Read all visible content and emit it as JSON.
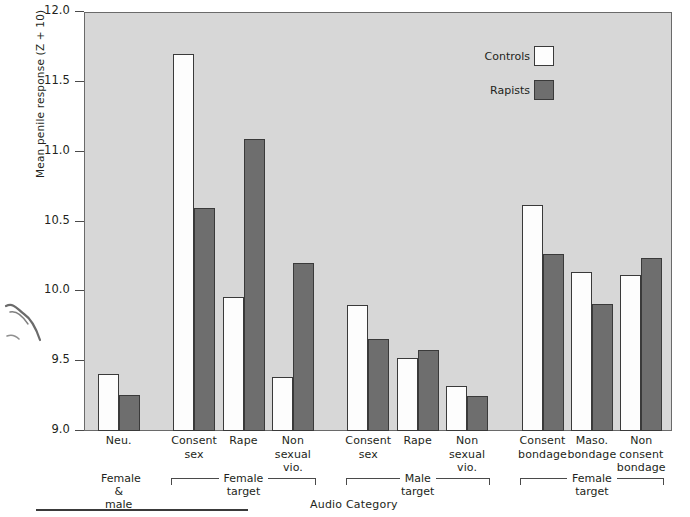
{
  "chart_data": {
    "type": "bar",
    "title": "",
    "xlabel": "Audio Category",
    "ylabel": "Mean penile response (Z + 10)",
    "ylim": [
      9.0,
      12.0
    ],
    "yticks": [
      "9.0",
      "9.5",
      "10.0",
      "10.5",
      "11.0",
      "11.5",
      "12.0"
    ],
    "ytick_values": [
      9.0,
      9.5,
      10.0,
      10.5,
      11.0,
      11.5,
      12.0
    ],
    "grid": false,
    "legend_position": "top-right",
    "categories": [
      "Neu.",
      "Consent sex",
      "Rape",
      "Non sexual vio.",
      "Consent sex",
      "Rape",
      "Non sexual vio.",
      "Consent bondage",
      "Maso. bondage",
      "Non consent bondage"
    ],
    "category_lines": [
      [
        "Neu."
      ],
      [
        "Consent",
        "sex"
      ],
      [
        "Rape"
      ],
      [
        "Non",
        "sexual",
        "vio."
      ],
      [
        "Consent",
        "sex"
      ],
      [
        "Rape"
      ],
      [
        "Non",
        "sexual",
        "vio."
      ],
      [
        "Consent",
        "bondage"
      ],
      [
        "Maso.",
        "bondage"
      ],
      [
        "Non",
        "consent",
        "bondage"
      ]
    ],
    "series": [
      {
        "name": "Controls",
        "color": "#fdfdfd",
        "values": [
          9.41,
          11.7,
          9.96,
          9.39,
          9.9,
          9.52,
          9.32,
          10.62,
          10.14,
          10.12
        ]
      },
      {
        "name": "Rapists",
        "color": "#6e6e6e",
        "values": [
          9.26,
          10.6,
          11.09,
          10.2,
          9.66,
          9.58,
          9.25,
          10.27,
          9.91,
          10.24
        ]
      }
    ],
    "groups": [
      {
        "name": "Female",
        "sub": "&",
        "extra": "male",
        "bracket": false,
        "members": [
          0
        ]
      },
      {
        "name": "Female",
        "sub": "target",
        "bracket": true,
        "members": [
          1,
          2,
          3
        ]
      },
      {
        "name": "Male",
        "sub": "target",
        "bracket": true,
        "members": [
          4,
          5,
          6
        ]
      },
      {
        "name": "Female",
        "sub": "target",
        "bracket": true,
        "members": [
          7,
          8,
          9
        ]
      }
    ]
  },
  "legend": {
    "items": [
      {
        "label": "Controls",
        "swatch": "white-square"
      },
      {
        "label": "Rapists",
        "swatch": "dark-gray-square"
      }
    ]
  },
  "colors": {
    "plot_background": "#d7d7d7",
    "controls_bar": "#fdfdfd",
    "rapists_bar": "#6e6e6e",
    "axis": "#4a4a4a",
    "text": "#231f20"
  }
}
